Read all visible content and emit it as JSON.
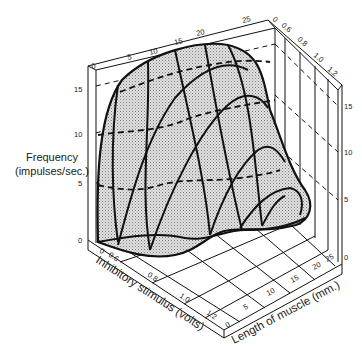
{
  "figure": {
    "type": "3d-surface",
    "z_axis": {
      "label_line1": "Frequency",
      "label_line2": "(impulses/sec.)",
      "ticks": [
        "0",
        "5",
        "10",
        "15"
      ]
    },
    "x_axis": {
      "label": "Inhibitory stimulus (volts)",
      "ticks": [
        "0",
        "0.6",
        "0.8",
        "1.0",
        "1.2"
      ]
    },
    "y_axis": {
      "label": "Length of muscle (mm.)",
      "ticks": [
        "0",
        "5",
        "10",
        "15",
        "20",
        "25"
      ]
    },
    "colors": {
      "line": "#111111",
      "surface_fill": "#d6d6d6",
      "background": "#ffffff"
    }
  }
}
